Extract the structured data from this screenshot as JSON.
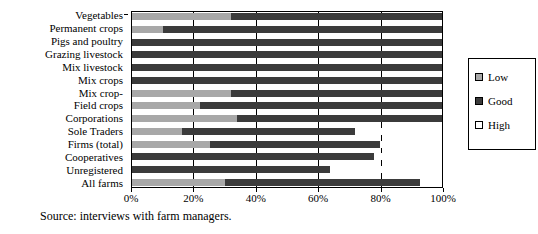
{
  "chart_data": {
    "type": "bar",
    "orientation": "horizontal",
    "stacked": true,
    "stack_mode": "percent",
    "title": "",
    "xlabel": "",
    "ylabel": "",
    "xlim": [
      0,
      100
    ],
    "xticks": [
      0,
      20,
      40,
      60,
      80,
      100
    ],
    "xticklabels": [
      "0%",
      "20%",
      "40%",
      "60%",
      "80%",
      "100%"
    ],
    "grid": true,
    "legend_position": "right",
    "categories": [
      "Vegetables",
      "Permanent crops",
      "Pigs and poultry",
      "Grazing livestock",
      "Mix livestock",
      "Mix crops",
      "Mix crop-",
      "Field crops",
      "Corporations",
      "Sole Traders",
      "Firms (total)",
      "Cooperatives",
      "Unregistered",
      "All farms"
    ],
    "series": [
      {
        "name": "Low",
        "color": "#a8a8a8",
        "values": [
          32,
          10,
          0,
          0,
          0,
          0,
          32,
          22,
          34,
          16,
          25,
          0,
          0,
          30
        ]
      },
      {
        "name": "Good",
        "color": "#3b3b3b",
        "values": [
          68,
          90,
          100,
          100,
          100,
          100,
          68,
          78,
          66,
          56,
          55,
          78,
          64,
          63
        ]
      },
      {
        "name": "High",
        "color": "#ffffff",
        "values": [
          0,
          0,
          0,
          0,
          0,
          0,
          0,
          0,
          0,
          28,
          20,
          22,
          36,
          7
        ]
      }
    ]
  },
  "legend": {
    "items": [
      {
        "label": "Low",
        "swatch": "sw-low"
      },
      {
        "label": "Good",
        "swatch": "sw-good"
      },
      {
        "label": "High",
        "swatch": "sw-high"
      }
    ]
  },
  "source": {
    "text": "Source: interviews with farm managers."
  }
}
